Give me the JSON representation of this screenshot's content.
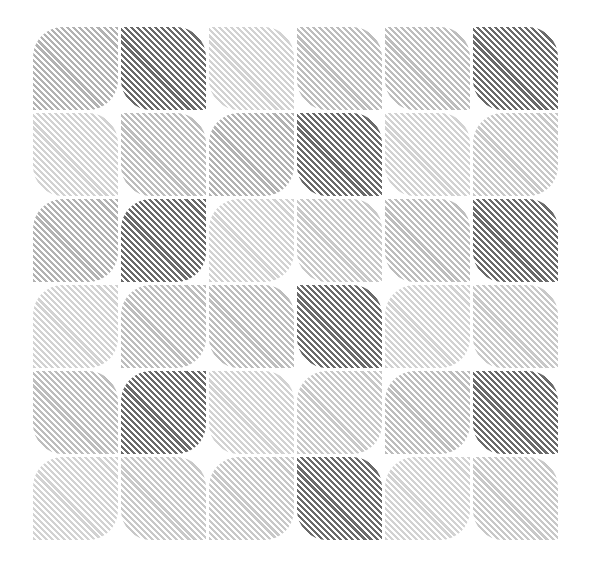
{
  "pattern": {
    "rows": 6,
    "cols": 6,
    "stripe_direction": "diagonal-top-left-to-bottom-right",
    "background": "#ffffff",
    "shades": {
      "dark": "#6a6a6a",
      "mid": "#b2b2b2",
      "midlight": "#bdbdbd",
      "light": "#c8c8c8",
      "verylight": "#d2d2d2"
    },
    "tiles": [
      [
        {
          "shade": "mid",
          "corners": "tl-br"
        },
        {
          "shade": "dark",
          "corners": "tr-bl"
        },
        {
          "shade": "verylight",
          "corners": "tr-bl"
        },
        {
          "shade": "midlight",
          "corners": "tr-bl"
        },
        {
          "shade": "midlight",
          "corners": "tr-bl"
        },
        {
          "shade": "dark",
          "corners": "tr-bl"
        }
      ],
      [
        {
          "shade": "verylight",
          "corners": "tr-bl"
        },
        {
          "shade": "midlight",
          "corners": "tr-bl"
        },
        {
          "shade": "mid",
          "corners": "tl-br"
        },
        {
          "shade": "dark",
          "corners": "tr-bl"
        },
        {
          "shade": "verylight",
          "corners": "tr-bl"
        },
        {
          "shade": "light",
          "corners": "tl-br"
        }
      ],
      [
        {
          "shade": "mid",
          "corners": "tl-br"
        },
        {
          "shade": "dark",
          "corners": "tl-br"
        },
        {
          "shade": "verylight",
          "corners": "tl-br"
        },
        {
          "shade": "light",
          "corners": "tr-bl"
        },
        {
          "shade": "midlight",
          "corners": "tr-bl"
        },
        {
          "shade": "dark",
          "corners": "tr-bl"
        }
      ],
      [
        {
          "shade": "verylight",
          "corners": "tl-br"
        },
        {
          "shade": "midlight",
          "corners": "tl-br"
        },
        {
          "shade": "midlight",
          "corners": "tr-bl"
        },
        {
          "shade": "dark",
          "corners": "tr-bl"
        },
        {
          "shade": "verylight",
          "corners": "tl-br"
        },
        {
          "shade": "light",
          "corners": "tr-bl"
        }
      ],
      [
        {
          "shade": "midlight",
          "corners": "tr-bl"
        },
        {
          "shade": "dark",
          "corners": "tl-br"
        },
        {
          "shade": "verylight",
          "corners": "tr-bl"
        },
        {
          "shade": "light",
          "corners": "tl-br"
        },
        {
          "shade": "midlight",
          "corners": "tl-br"
        },
        {
          "shade": "dark",
          "corners": "tr-bl"
        }
      ],
      [
        {
          "shade": "verylight",
          "corners": "tl-br"
        },
        {
          "shade": "light",
          "corners": "tr-bl"
        },
        {
          "shade": "light",
          "corners": "tl-br"
        },
        {
          "shade": "dark",
          "corners": "tr-bl"
        },
        {
          "shade": "verylight",
          "corners": "tl-br"
        },
        {
          "shade": "light",
          "corners": "tr-bl"
        }
      ]
    ]
  }
}
